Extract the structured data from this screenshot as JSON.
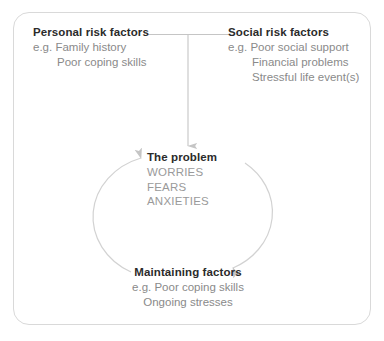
{
  "figure": {
    "border_color": "#d9d9d9",
    "heading_color": "#2b2b2b",
    "body_color": "#8a8a8a",
    "arrow_color": "#c5c5c5",
    "background": "#ffffff"
  },
  "personal": {
    "heading": "Personal risk factors",
    "items": [
      "e.g. Family history",
      "Poor coping skills"
    ]
  },
  "social": {
    "heading": "Social risk factors",
    "items": [
      "e.g. Poor social support",
      "Financial problems",
      "Stressful life event(s)"
    ]
  },
  "problem": {
    "heading": "The problem",
    "items": [
      "WORRIES",
      "FEARS",
      "ANXIETIES"
    ]
  },
  "maintaining": {
    "heading": "Maintaining factors",
    "items": [
      "e.g. Poor coping skills",
      "Ongoing stresses"
    ]
  },
  "connectors": {
    "top_join_label": "risk-factors-join",
    "down_arrow_label": "risk-factors-to-problem",
    "loop_right_label": "problem-to-maintaining",
    "loop_left_label": "maintaining-to-problem"
  }
}
